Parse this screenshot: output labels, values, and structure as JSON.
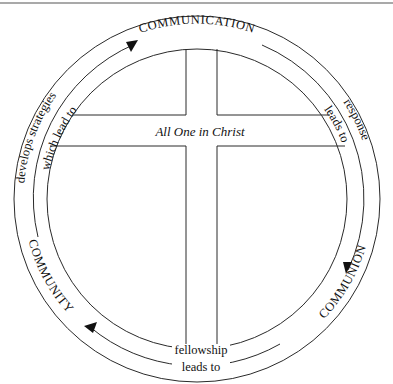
{
  "diagram": {
    "center_label": "All One in Christ",
    "stages": [
      {
        "id": "communication",
        "label": "COMMUNICATION"
      },
      {
        "id": "communion",
        "label": "COMMUNION"
      },
      {
        "id": "community",
        "label": "COMMUNITY"
      }
    ],
    "connectors": {
      "response": "response",
      "response_leads_to": "leads to",
      "fellowship": "fellowship",
      "fellowship_leads_to": "leads to",
      "develops_strategies": "develops strategies",
      "which_lead_to": "which lead to"
    },
    "flow": [
      "COMMUNICATION",
      "COMMUNION",
      "COMMUNITY",
      "COMMUNICATION"
    ],
    "direction": "clockwise"
  }
}
